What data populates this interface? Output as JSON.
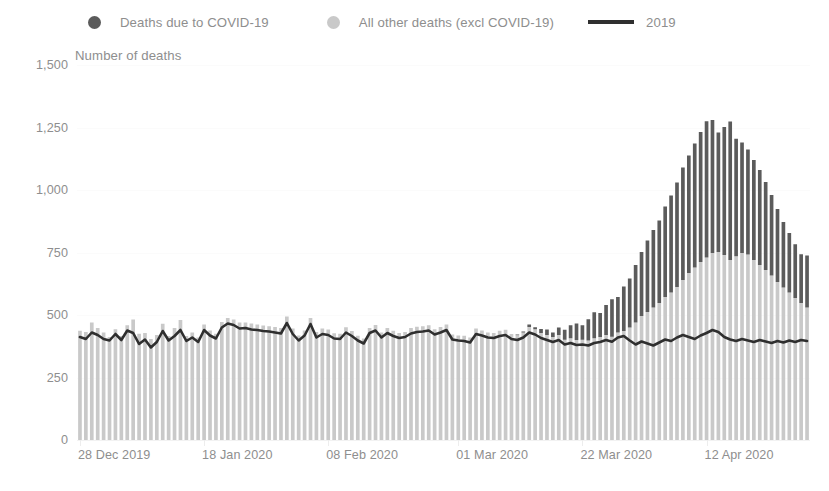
{
  "legend": {
    "items": [
      {
        "label": "Deaths due to COVID-19",
        "marker": "circle-icon",
        "color": "#5b5b5b"
      },
      {
        "label": "All other deaths (excl COVID-19)",
        "marker": "circle-icon",
        "color": "#c9c9c9"
      },
      {
        "label": "2019",
        "marker": "line-icon",
        "color": "#2f2f2f"
      }
    ]
  },
  "axis_title": "Number of deaths",
  "chart_data": {
    "type": "bar",
    "title": "",
    "subtitle": "",
    "xlabel": "",
    "ylabel": "Number of deaths",
    "ylim": [
      0,
      1500
    ],
    "yticks": [
      0,
      250,
      500,
      750,
      1000,
      1250,
      1500
    ],
    "ytick_labels": [
      "0",
      "250",
      "500",
      "750",
      "1,000",
      "1,250",
      "1,500"
    ],
    "grid": true,
    "legend_position": "top",
    "stacked": true,
    "bar_start_date": "28 Dec 2019",
    "xtick_labels": [
      "28 Dec 2019",
      "18 Jan 2020",
      "08 Feb 2020",
      "01 Mar 2020",
      "22 Mar 2020",
      "12 Apr 2020"
    ],
    "xtick_indices": [
      0,
      21,
      42,
      64,
      85,
      106
    ],
    "series": [
      {
        "name": "All other deaths (excl COVID-19)",
        "color": "#c9c9c9",
        "values": [
          437,
          432,
          470,
          448,
          430,
          412,
          443,
          416,
          459,
          482,
          425,
          428,
          404,
          420,
          465,
          416,
          448,
          480,
          416,
          430,
          410,
          462,
          438,
          425,
          472,
          488,
          482,
          470,
          470,
          466,
          462,
          458,
          455,
          452,
          448,
          494,
          446,
          418,
          438,
          488,
          432,
          446,
          442,
          427,
          425,
          451,
          436,
          417,
          406,
          448,
          460,
          430,
          448,
          437,
          428,
          432,
          448,
          453,
          455,
          459,
          443,
          452,
          462,
          422,
          418,
          417,
          410,
          446,
          438,
          430,
          428,
          437,
          441,
          424,
          420,
          430,
          452,
          443,
          428,
          420,
          412,
          420,
          401,
          407,
          400,
          401,
          398,
          407,
          412,
          420,
          413,
          430,
          436,
          450,
          470,
          496,
          512,
          530,
          548,
          572,
          590,
          612,
          640,
          668,
          690,
          712,
          730,
          748,
          752,
          740,
          720,
          735,
          748,
          742,
          720,
          700,
          680,
          658,
          632,
          610,
          590,
          568,
          548,
          530
        ]
      },
      {
        "name": "Deaths due to COVID-19",
        "color": "#5b5b5b",
        "values": [
          0,
          0,
          0,
          0,
          0,
          0,
          0,
          0,
          0,
          0,
          0,
          0,
          0,
          0,
          0,
          0,
          0,
          0,
          0,
          0,
          0,
          0,
          0,
          0,
          0,
          0,
          0,
          0,
          0,
          0,
          0,
          0,
          0,
          0,
          0,
          0,
          0,
          0,
          0,
          0,
          0,
          0,
          0,
          0,
          0,
          0,
          0,
          0,
          0,
          0,
          0,
          0,
          0,
          0,
          0,
          0,
          0,
          0,
          0,
          0,
          0,
          0,
          0,
          0,
          0,
          0,
          0,
          0,
          0,
          0,
          0,
          0,
          0,
          0,
          2,
          4,
          10,
          8,
          16,
          22,
          18,
          30,
          40,
          52,
          66,
          58,
          85,
          104,
          96,
          120,
          150,
          142,
          178,
          196,
          230,
          256,
          286,
          310,
          330,
          362,
          388,
          418,
          450,
          470,
          496,
          520,
          545,
          532,
          478,
          512,
          554,
          470,
          442,
          420,
          400,
          380,
          352,
          322,
          292,
          262,
          238,
          215,
          195,
          208
        ]
      }
    ],
    "line_series": {
      "name": "2019",
      "color": "#2f2f2f",
      "values": [
        412,
        404,
        430,
        420,
        404,
        398,
        424,
        400,
        438,
        428,
        384,
        402,
        370,
        392,
        436,
        398,
        416,
        440,
        396,
        410,
        392,
        440,
        418,
        406,
        450,
        466,
        460,
        446,
        448,
        442,
        440,
        436,
        434,
        430,
        426,
        468,
        424,
        398,
        418,
        464,
        410,
        424,
        420,
        406,
        404,
        430,
        416,
        398,
        386,
        428,
        438,
        410,
        428,
        416,
        408,
        412,
        426,
        432,
        434,
        438,
        422,
        430,
        440,
        402,
        398,
        396,
        390,
        424,
        418,
        410,
        408,
        416,
        420,
        404,
        400,
        410,
        430,
        422,
        408,
        400,
        392,
        400,
        382,
        388,
        380,
        382,
        378,
        388,
        392,
        400,
        393,
        410,
        416,
        398,
        382,
        394,
        386,
        378,
        390,
        402,
        396,
        410,
        420,
        412,
        404,
        418,
        428,
        440,
        432,
        412,
        402,
        396,
        404,
        398,
        392,
        400,
        394,
        388,
        396,
        390,
        398,
        392,
        400,
        396
      ]
    }
  }
}
